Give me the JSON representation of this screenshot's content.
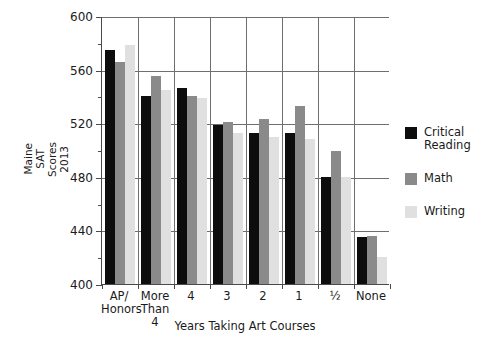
{
  "chart_data": {
    "type": "bar",
    "title": "",
    "xlabel": "Years Taking Art Courses",
    "ylabel": "Maine SAT Scores 2013",
    "ylabel_lines": [
      "Maine",
      "SAT",
      "Scores",
      "2013"
    ],
    "categories": [
      "AP/ Honors",
      "More Than 4",
      "4",
      "3",
      "2",
      "1",
      "½",
      "None"
    ],
    "category_lines": [
      [
        "AP/",
        "Honors"
      ],
      [
        "More",
        "Than",
        "4"
      ],
      [
        "4"
      ],
      [
        "3"
      ],
      [
        "2"
      ],
      [
        "1"
      ],
      [
        "½"
      ],
      [
        "None"
      ]
    ],
    "series": [
      {
        "name": "Critical Reading",
        "color": "#0d0d0d",
        "values": [
          575,
          540,
          546,
          519,
          513,
          513,
          480,
          435
        ]
      },
      {
        "name": "Math",
        "color": "#8a8a8a",
        "values": [
          566,
          555,
          540,
          521,
          523,
          533,
          499,
          436
        ]
      },
      {
        "name": "Writing",
        "color": "#e0e0e0",
        "values": [
          578,
          545,
          539,
          513,
          510,
          508,
          480,
          420
        ]
      }
    ],
    "ylim": [
      400,
      600
    ],
    "yticks": [
      400,
      440,
      480,
      520,
      560,
      600
    ],
    "ytick_labels": [
      "400",
      "440",
      "480",
      "520",
      "560",
      "600"
    ],
    "yminor_ticks": [
      420,
      460,
      500,
      540,
      580
    ],
    "grid": "horizontal-and-vertical",
    "legend_position": "right"
  },
  "legend": {
    "entries": [
      {
        "label": "Critical\nReading"
      },
      {
        "label": "Math"
      },
      {
        "label": "Writing"
      }
    ]
  }
}
